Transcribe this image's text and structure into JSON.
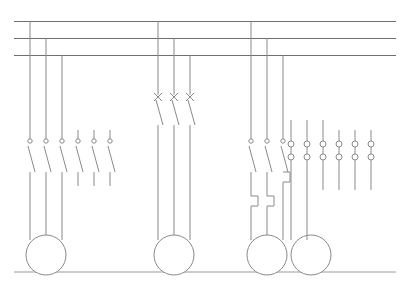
{
  "document": {
    "title_faint": "",
    "type": "electrical-power-schematic",
    "description": "Three-phase distribution busbar schematic with four motor feeders"
  },
  "canvas": {
    "width": 402,
    "height": 288,
    "background": "#ffffff"
  },
  "style": {
    "line_color": "#8a8a8a",
    "busbar_color": "#6f6f6f",
    "frame_color": "#9a9a9a",
    "line_width": 1
  },
  "busbars": [
    {
      "name": "L1",
      "y": 21,
      "x1": 14,
      "x2": 396
    },
    {
      "name": "L2",
      "y": 38,
      "x1": 14,
      "x2": 396
    },
    {
      "name": "L3",
      "y": 55,
      "x1": 14,
      "x2": 396
    }
  ],
  "frame": {
    "bottom_rule_y": 272,
    "x1": 14,
    "x2": 396
  },
  "feeders": [
    {
      "id": "feeder-1",
      "name": "motor-feeder-left",
      "device": "contactor",
      "phase_drops_x": [
        30,
        46,
        62
      ],
      "contact_top_y": 139,
      "contact_bottom_y": 172,
      "motor": {
        "cx": 46,
        "cy": 255,
        "r": 20
      },
      "extra_contacts_x": [
        78,
        94,
        110
      ],
      "extra_contacts_label": "auxiliary-contacts"
    },
    {
      "id": "feeder-2",
      "name": "motor-feeder-center",
      "device": "fused-disconnect",
      "phase_drops_x": [
        158,
        174,
        190
      ],
      "contact_top_y": 95,
      "contact_bottom_y": 125,
      "motor": {
        "cx": 174,
        "cy": 255,
        "r": 20
      }
    },
    {
      "id": "feeder-3",
      "name": "motor-feeder-right-a",
      "device": "contactor-with-overload",
      "phase_drops_x": [
        251,
        267,
        283
      ],
      "contact_top_y": 139,
      "contact_bottom_y": 172,
      "overload_y": 196,
      "motor": {
        "cx": 267,
        "cy": 255,
        "r": 20
      }
    },
    {
      "id": "feeder-4",
      "name": "motor-feeder-right-b",
      "device": "terminal-block-feed",
      "phase_drops_x": [
        299,
        315,
        331
      ],
      "motor": {
        "cx": 311,
        "cy": 255,
        "r": 20
      }
    }
  ],
  "terminal_block": {
    "name": "terminal-strip",
    "top_row_y": 144,
    "bottom_row_y": 157,
    "terminal_x": [
      291,
      307,
      323,
      339,
      355,
      371
    ],
    "radius": 3
  },
  "symbols": {
    "contact_terminal_dot_r": 2.2,
    "fuse_mark": "x-cross",
    "overload_shape": "step-heater"
  },
  "legend": {
    "busbar_label": "three-phase busbars",
    "motor_label": "motor",
    "contact_label": "normally-open contact",
    "fuse_label": "fuse",
    "overload_label": "thermal overload heater",
    "terminal_label": "terminal"
  }
}
